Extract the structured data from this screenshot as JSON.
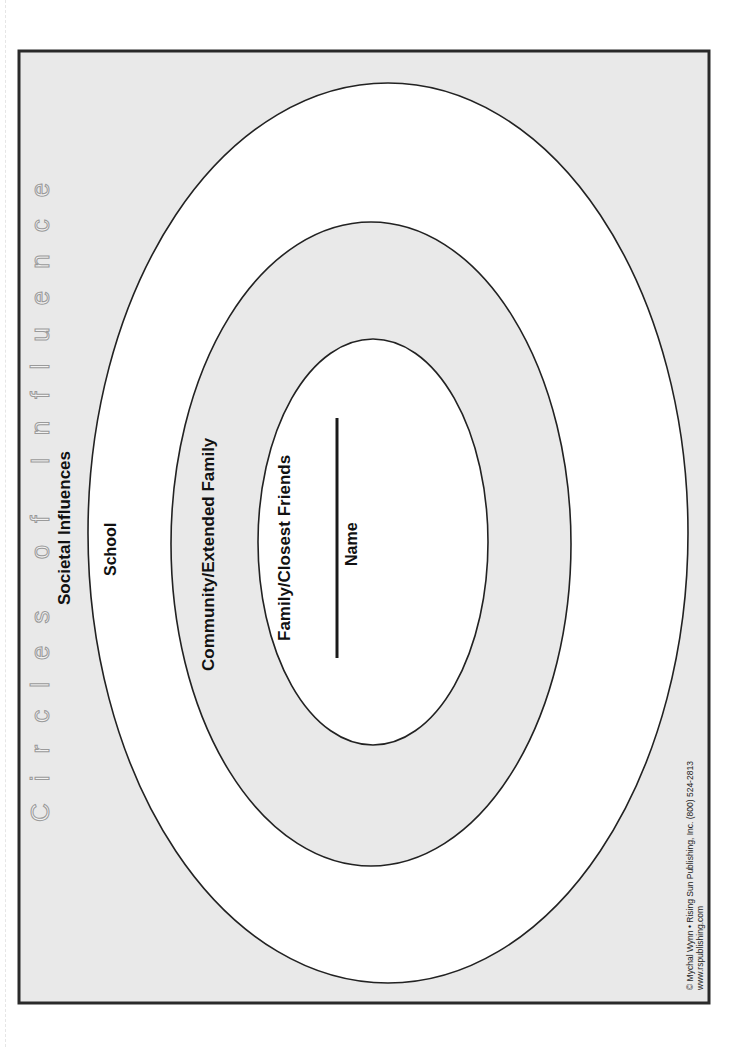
{
  "worksheet": {
    "title": "Circles of Influence",
    "rings": [
      {
        "label": "Societal Influences"
      },
      {
        "label": "School"
      },
      {
        "label": "Community/Extended Family"
      },
      {
        "label": "Family/Closest Friends"
      }
    ],
    "name_field": {
      "label": "Name"
    },
    "copyright": {
      "line1": "© Mychal Wynn • Rising Sun Publishing, Inc. (800) 524-2813",
      "line2": "www.rspublishing.com"
    }
  },
  "colors": {
    "frame_fill": "#e9e9e9",
    "ring_gray": "#e9e9e9",
    "ring_white": "#ffffff",
    "stroke": "#222222"
  }
}
